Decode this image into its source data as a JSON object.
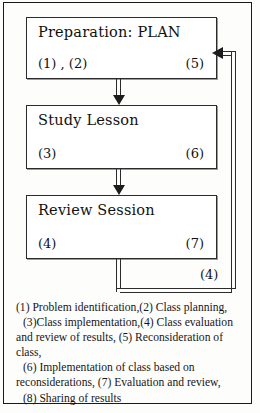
{
  "boxes": [
    {
      "title": "Preparation: PLAN",
      "left_tag": "(1) , (2)",
      "right_tag": "(5)"
    },
    {
      "title": "Study Lesson",
      "left_tag": "(3)",
      "right_tag": "(6)"
    },
    {
      "title": "Review Session",
      "left_tag": "(4)",
      "right_tag": "(7)"
    }
  ],
  "loop": {
    "tag": "(4)"
  },
  "legend": {
    "lines": [
      "(1) Problem identification,(2) Class planning,",
      "(3)Class implementation,(4) Class evaluation",
      "and review of results, (5) Reconsideration of",
      "class,",
      "(6) Implementation of class based on",
      "reconsiderations, (7) Evaluation and review,",
      "(8) Sharing of results"
    ],
    "indent_flags": [
      false,
      true,
      false,
      false,
      true,
      false,
      true
    ]
  },
  "colors": {
    "ink": "#1a1a1a",
    "box_border": "#2b2b2b",
    "page": "#fdfdfc"
  }
}
